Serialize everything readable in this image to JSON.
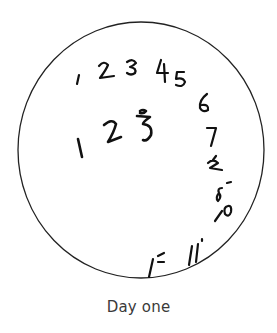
{
  "figure": {
    "caption": "Day one",
    "clock_face": {
      "outline_color": "#222222",
      "ink_color": "#111111",
      "outer_row_numbers": [
        "1",
        "2",
        "3",
        "4",
        "5",
        "6",
        "7",
        "8",
        "9",
        "10",
        "11",
        "12"
      ],
      "inner_row_numbers": [
        "1",
        "2",
        "3"
      ]
    }
  }
}
